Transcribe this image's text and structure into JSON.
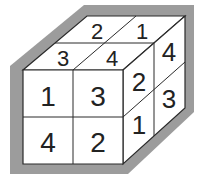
{
  "figure": {
    "type": "2x2x2 numbered cube (isometric view)",
    "colors": {
      "border": "#9c9c9c",
      "line": "#2a2a2a",
      "face": "#ffffff",
      "text": "#222222"
    },
    "front_face": {
      "cells": [
        {
          "row": 0,
          "col": 0,
          "value": "1"
        },
        {
          "row": 0,
          "col": 1,
          "value": "3"
        },
        {
          "row": 1,
          "col": 0,
          "value": "4"
        },
        {
          "row": 1,
          "col": 1,
          "value": "2"
        }
      ]
    },
    "top_face": {
      "cells": [
        {
          "position": "back-left",
          "value": "2"
        },
        {
          "position": "back-right",
          "value": "1"
        },
        {
          "position": "front-left",
          "value": "3"
        },
        {
          "position": "front-right",
          "value": "4"
        }
      ]
    },
    "right_face": {
      "cells": [
        {
          "position": "top-front",
          "value": "2"
        },
        {
          "position": "top-back",
          "value": "4"
        },
        {
          "position": "bottom-front",
          "value": "1"
        },
        {
          "position": "bottom-back",
          "value": "3"
        }
      ]
    }
  }
}
